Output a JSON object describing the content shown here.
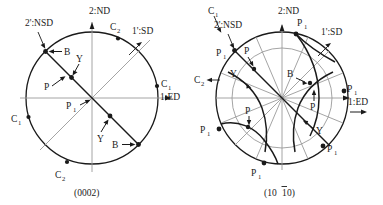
{
  "figures": [
    {
      "id": "left",
      "caption": "(0002)",
      "axes": {
        "nd_label": "2:ND",
        "ed_label": "1:ED",
        "sd_label": "1':SD",
        "nsd_label": "2':NSD"
      },
      "pole_labels": {
        "c1": "C",
        "c1_sub": "1",
        "c2": "C",
        "c2_sub": "2",
        "p1": "P",
        "p1_sub": "1",
        "b": "B",
        "y": "Y",
        "p": "P"
      },
      "markers": [
        {
          "name": "C2",
          "text": "C",
          "sub": "2",
          "note": "top of circle, near 2:ND"
        },
        {
          "name": "C1",
          "text": "C",
          "sub": "1",
          "note": "right of circle, near 1:ED"
        },
        {
          "name": "C1b",
          "text": "C",
          "sub": "1",
          "note": "left of circle"
        },
        {
          "name": "C2b",
          "text": "C",
          "sub": "2",
          "note": "bottom of circle"
        },
        {
          "name": "B",
          "text": "B",
          "sub": "",
          "note": "upper-left on NSD trace"
        },
        {
          "name": "B2",
          "text": "B",
          "sub": "",
          "note": "lower-right on NSD trace"
        },
        {
          "name": "P",
          "text": "P",
          "sub": "",
          "note": "upper-left inner"
        },
        {
          "name": "Y",
          "text": "Y",
          "sub": "",
          "note": "upper inner"
        },
        {
          "name": "Y2",
          "text": "Y",
          "sub": "",
          "note": "lower inner"
        },
        {
          "name": "P1",
          "text": "P",
          "sub": "1",
          "note": "center"
        }
      ]
    },
    {
      "id": "right",
      "caption_pre": "(10",
      "caption_bar": "1",
      "caption_post": "0)",
      "caption": "(1010)",
      "axes": {
        "nd_label": "2:ND",
        "ed_label": "1:ED",
        "sd_label": "1':SD",
        "nsd_label": "2':NSD"
      },
      "pole_labels": {
        "c1": "C",
        "c1_sub": "1",
        "c2": "C",
        "c2_sub": "2",
        "p1": "P",
        "p1_sub": "1",
        "b": "B",
        "y": "Y",
        "p": "P"
      },
      "markers": [
        {
          "name": "C1",
          "text": "C",
          "sub": "1",
          "note": "top-left outside, arrow to rim"
        },
        {
          "name": "C2",
          "text": "C",
          "sub": "2",
          "note": "left outside, arrow to rim"
        },
        {
          "name": "P1-a",
          "text": "P",
          "sub": "1",
          "note": "top, right of 2:ND"
        },
        {
          "name": "P1-b",
          "text": "P",
          "sub": "1",
          "note": "upper-left rim"
        },
        {
          "name": "P1-c",
          "text": "P",
          "sub": "1",
          "note": "right rim near 1:ED"
        },
        {
          "name": "P1-d",
          "text": "P",
          "sub": "1",
          "note": "lower-left rim"
        },
        {
          "name": "P1-e",
          "text": "P",
          "sub": "1",
          "note": "lower-right rim"
        },
        {
          "name": "P1-f",
          "text": "P",
          "sub": "1",
          "note": "bottom rim"
        },
        {
          "name": "P-a",
          "text": "P",
          "sub": "",
          "note": "upper-left inner"
        },
        {
          "name": "P-b",
          "text": "P",
          "sub": "",
          "note": "right-center inner"
        },
        {
          "name": "P-c",
          "text": "P",
          "sub": "",
          "note": "lower-left inner"
        },
        {
          "name": "B",
          "text": "B",
          "sub": "",
          "note": "upper-right inner"
        },
        {
          "name": "Y-a",
          "text": "Y",
          "sub": "",
          "note": "upper-left inner"
        },
        {
          "name": "Y-b",
          "text": "Y",
          "sub": "",
          "note": "lower-right inner"
        }
      ]
    }
  ],
  "colors": {
    "stroke_dark": "#1a1a1a",
    "stroke_light": "#8a8a8a",
    "background": "#ffffff"
  }
}
